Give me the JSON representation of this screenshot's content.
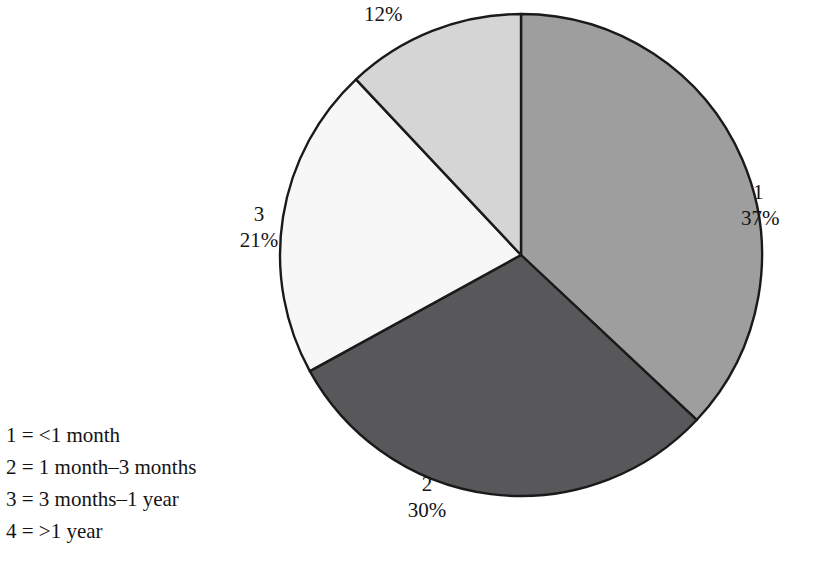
{
  "chart_data": {
    "type": "pie",
    "title": "",
    "subtitle": "",
    "xlabel": "",
    "ylabel": "",
    "grid": false,
    "legend_position": "bottom-left",
    "start_angle_deg": 0,
    "direction": "clockwise",
    "categories": [
      "1",
      "2",
      "3",
      "4"
    ],
    "values": [
      37,
      30,
      21,
      12
    ],
    "value_unit": "%",
    "slices": [
      {
        "key": "1",
        "label": "1",
        "percent": 37,
        "percent_text": "37%",
        "definition": "<1 month",
        "color": "#9e9e9e",
        "label_position": "right",
        "show_key_label": true
      },
      {
        "key": "2",
        "label": "2",
        "percent": 30,
        "percent_text": "30%",
        "definition": "1 month–3 months",
        "color": "#58585a",
        "label_position": "bottom",
        "show_key_label": true
      },
      {
        "key": "3",
        "label": "3",
        "percent": 21,
        "percent_text": "21%",
        "definition": "3 months–1 year",
        "color": "#f7f7f7",
        "label_position": "left",
        "show_key_label": true
      },
      {
        "key": "4",
        "label": "",
        "percent": 12,
        "percent_text": "12%",
        "definition": ">1 year",
        "color": "#d5d5d5",
        "label_position": "top",
        "show_key_label": false
      }
    ],
    "annotations": [],
    "stroke_color": "#1a1a1a"
  },
  "legend": {
    "entries": [
      {
        "text": "1 = <1 month"
      },
      {
        "text": "2 = 1 month–3 months"
      },
      {
        "text": "3 = 3 months–1 year"
      },
      {
        "text": "4 = >1 year"
      }
    ]
  }
}
